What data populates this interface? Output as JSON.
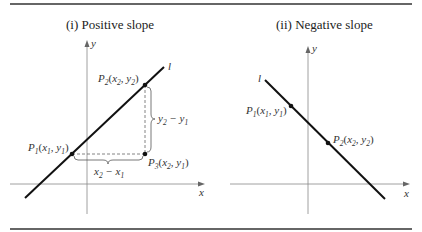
{
  "figures": [
    {
      "title": "(i)  Positive slope",
      "line_label": "l",
      "axis_x_label": "x",
      "axis_y_label": "y",
      "points": [
        {
          "name": "P",
          "sub": "1",
          "coords": "(x",
          "c1": "1",
          "sep": ", y",
          "c2": "1",
          "close": ")"
        },
        {
          "name": "P",
          "sub": "2",
          "coords": "(x",
          "c1": "2",
          "sep": ", y",
          "c2": "2",
          "close": ")"
        },
        {
          "name": "P",
          "sub": "3",
          "coords": "(x",
          "c1": "2",
          "sep": ", y",
          "c2": "1",
          "close": ")"
        }
      ],
      "rise_label": {
        "a": "y",
        "a_sub": "2",
        "op": " − y",
        "b_sub": "1"
      },
      "run_label": {
        "a": "x",
        "a_sub": "2",
        "op": " − x",
        "b_sub": "1"
      }
    },
    {
      "title": "(ii)  Negative slope",
      "line_label": "l",
      "axis_x_label": "x",
      "axis_y_label": "y",
      "points": [
        {
          "name": "P",
          "sub": "1",
          "coords": "(x",
          "c1": "1",
          "sep": ", y",
          "c2": "1",
          "close": ")"
        },
        {
          "name": "P",
          "sub": "2",
          "coords": "(x",
          "c1": "2",
          "sep": ", y",
          "c2": "2",
          "close": ")"
        }
      ]
    }
  ]
}
